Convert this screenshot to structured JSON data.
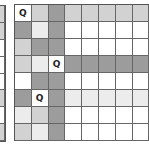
{
  "diagram": {
    "title": "",
    "queen_symbol": "Q",
    "colors": {
      "white": "#ffffff",
      "very_light": "#ececec",
      "light": "#d2d2d2",
      "dark": "#9c9c9c",
      "grid": "#666666"
    },
    "left_board_partial": {
      "rows": [
        "l",
        "l",
        "w",
        "w",
        "w",
        "l",
        "w",
        "l"
      ]
    },
    "board": {
      "columns_visible": 8,
      "rows_visible": 8,
      "queens": [
        {
          "row": 0,
          "col": 0
        },
        {
          "row": 3,
          "col": 2
        },
        {
          "row": 5,
          "col": 1
        }
      ],
      "rows": [
        [
          "q",
          "l",
          "d",
          "l",
          "l",
          "l",
          "l",
          "l"
        ],
        [
          "d",
          "vl",
          "d",
          "w",
          "w",
          "w",
          "w",
          "w"
        ],
        [
          "l",
          "d",
          "d",
          "w",
          "w",
          "w",
          "w",
          "w"
        ],
        [
          "l",
          "vl",
          "q",
          "d",
          "d",
          "d",
          "d",
          "d"
        ],
        [
          "w",
          "d",
          "d",
          "w",
          "w",
          "w",
          "w",
          "w"
        ],
        [
          "d",
          "q",
          "d",
          "vl",
          "vl",
          "vl",
          "vl",
          "vl"
        ],
        [
          "vl",
          "l",
          "d",
          "w",
          "w",
          "w",
          "w",
          "w"
        ],
        [
          "l",
          "vl",
          "d",
          "w",
          "w",
          "w",
          "w",
          "w"
        ]
      ]
    }
  }
}
